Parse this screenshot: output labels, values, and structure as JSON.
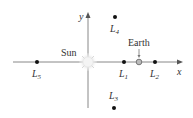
{
  "diagram": {
    "axes": {
      "x_label": "x",
      "y_label": "y"
    },
    "bodies": [
      {
        "name": "Sun",
        "label": "Sun"
      },
      {
        "name": "Earth",
        "label": "Earth"
      }
    ],
    "points": [
      {
        "id": "L1",
        "letter": "L",
        "sub": "1"
      },
      {
        "id": "L2",
        "letter": "L",
        "sub": "2"
      },
      {
        "id": "L3",
        "letter": "L",
        "sub": "3"
      },
      {
        "id": "L4",
        "letter": "L",
        "sub": "4"
      },
      {
        "id": "L5",
        "letter": "L",
        "sub": "5"
      }
    ],
    "colors": {
      "axis": "#888888",
      "point": "#111111",
      "earth_fill": "#bbbbbb",
      "earth_stroke": "#777777",
      "sun_glow": "#e8e8e8"
    }
  }
}
